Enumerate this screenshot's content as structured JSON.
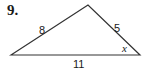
{
  "problem": {
    "number": "9.",
    "triangle": {
      "vertices": {
        "left": [
          11,
          55
        ],
        "apex": [
          88,
          5
        ],
        "right": [
          140,
          55
        ]
      },
      "sides": {
        "left_side": "8",
        "right_side": "5",
        "base": "11"
      },
      "angle_label": "x",
      "stroke_color": "#333333"
    }
  }
}
